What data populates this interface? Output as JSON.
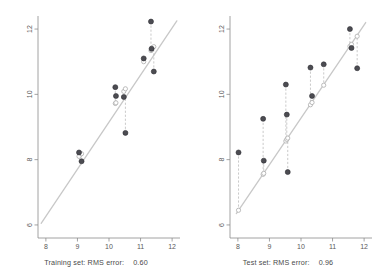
{
  "figure": {
    "width": 384,
    "height": 278,
    "background": "#ffffff",
    "panel_count": 2
  },
  "style": {
    "point_color": "#4c4c52",
    "point_edge_color": "#2e2e33",
    "line_color": "#c8c8c8",
    "residual_color": "#bdbdbd",
    "predicted_marker_color": "#b4b4b4",
    "axis_color": "#8c8c8c",
    "tick_label_color": "#5a5a5a",
    "caption_color": "#4a4a4a"
  },
  "chart_data": [
    {
      "type": "scatter",
      "panel": "left",
      "title": "",
      "xlabel": "",
      "ylabel": "",
      "xlim": [
        7.75,
        12.25
      ],
      "ylim": [
        5.6,
        12.4
      ],
      "xticks": [
        8,
        9,
        10,
        11,
        12
      ],
      "xtick_labels": [
        "8",
        "9",
        "10",
        "11",
        "12"
      ],
      "yticks": [
        6,
        8,
        10,
        12
      ],
      "ytick_labels": [
        "6",
        "8",
        "10",
        "12"
      ],
      "grid": false,
      "legend": null,
      "reference_line": {
        "name": "regression-line",
        "type": "line",
        "x": [
          7.85,
          12.15
        ],
        "y": [
          6.05,
          12.25
        ],
        "color": "#c8c8c8"
      },
      "series": [
        {
          "name": "observed",
          "marker": "filled-circle",
          "color": "#4c4c52",
          "x": [
            9.05,
            9.13,
            10.2,
            10.22,
            10.47,
            10.52,
            11.1,
            11.33,
            11.35,
            11.42
          ],
          "values": [
            8.22,
            7.95,
            10.22,
            9.95,
            9.92,
            8.82,
            11.1,
            12.23,
            11.4,
            10.7
          ]
        },
        {
          "name": "predicted",
          "marker": "open-circle",
          "color": "#b4b4b4",
          "x": [
            9.05,
            9.13,
            10.2,
            10.22,
            10.47,
            10.52,
            11.1,
            11.33,
            11.35,
            11.42
          ],
          "values": [
            8.1,
            8.18,
            9.72,
            9.74,
            10.09,
            10.17,
            11.0,
            11.34,
            11.36,
            11.46
          ]
        }
      ],
      "residual_pairs": [
        {
          "x": 9.05,
          "observed": 8.22,
          "predicted": 8.1
        },
        {
          "x": 9.13,
          "observed": 7.95,
          "predicted": 8.18
        },
        {
          "x": 10.2,
          "observed": 10.22,
          "predicted": 9.72
        },
        {
          "x": 10.22,
          "observed": 9.95,
          "predicted": 9.74
        },
        {
          "x": 10.47,
          "observed": 9.92,
          "predicted": 10.09
        },
        {
          "x": 10.52,
          "observed": 8.82,
          "predicted": 10.17
        },
        {
          "x": 11.1,
          "observed": 11.1,
          "predicted": 11.0
        },
        {
          "x": 11.33,
          "observed": 12.23,
          "predicted": 11.34
        },
        {
          "x": 11.35,
          "observed": 11.4,
          "predicted": 11.36
        },
        {
          "x": 11.42,
          "observed": 10.7,
          "predicted": 11.46
        }
      ],
      "caption_label": "Training set: RMS error:",
      "caption_value": "0.60"
    },
    {
      "type": "scatter",
      "panel": "right",
      "title": "",
      "xlabel": "",
      "ylabel": "",
      "xlim": [
        7.75,
        12.25
      ],
      "ylim": [
        5.6,
        12.4
      ],
      "xticks": [
        8,
        9,
        10,
        11,
        12
      ],
      "xtick_labels": [
        "8",
        "9",
        "10",
        "11",
        "12"
      ],
      "yticks": [
        6,
        8,
        10,
        12
      ],
      "ytick_labels": [
        "6",
        "8",
        "10",
        "12"
      ],
      "grid": false,
      "legend": null,
      "reference_line": {
        "name": "regression-line",
        "type": "line",
        "x": [
          7.95,
          12.05
        ],
        "y": [
          6.35,
          12.2
        ],
        "color": "#c8c8c8"
      },
      "series": [
        {
          "name": "observed",
          "marker": "filled-circle",
          "color": "#4c4c52",
          "x": [
            8.02,
            8.8,
            8.82,
            9.52,
            9.55,
            9.58,
            10.3,
            10.35,
            10.72,
            11.55,
            11.6,
            11.78
          ],
          "values": [
            8.22,
            9.25,
            7.97,
            10.3,
            9.38,
            7.62,
            10.82,
            9.95,
            10.92,
            12.0,
            11.42,
            10.8
          ]
        },
        {
          "name": "predicted",
          "marker": "open-circle",
          "color": "#b4b4b4",
          "x": [
            8.02,
            8.8,
            8.82,
            9.52,
            9.55,
            9.58,
            10.3,
            10.35,
            10.72,
            11.55,
            11.6,
            11.78
          ],
          "values": [
            6.45,
            7.55,
            7.58,
            8.57,
            8.62,
            8.66,
            9.68,
            9.75,
            10.28,
            11.47,
            11.53,
            11.78
          ]
        }
      ],
      "residual_pairs": [
        {
          "x": 8.02,
          "observed": 8.22,
          "predicted": 6.45
        },
        {
          "x": 8.8,
          "observed": 9.25,
          "predicted": 7.55
        },
        {
          "x": 8.82,
          "observed": 7.97,
          "predicted": 7.58
        },
        {
          "x": 9.52,
          "observed": 10.3,
          "predicted": 8.57
        },
        {
          "x": 9.55,
          "observed": 9.38,
          "predicted": 8.62
        },
        {
          "x": 9.58,
          "observed": 7.62,
          "predicted": 8.66
        },
        {
          "x": 10.3,
          "observed": 10.82,
          "predicted": 9.68
        },
        {
          "x": 10.35,
          "observed": 9.95,
          "predicted": 9.75
        },
        {
          "x": 10.72,
          "observed": 10.92,
          "predicted": 10.28
        },
        {
          "x": 11.55,
          "observed": 12.0,
          "predicted": 11.47
        },
        {
          "x": 11.6,
          "observed": 11.42,
          "predicted": 11.53
        },
        {
          "x": 11.78,
          "observed": 10.8,
          "predicted": 11.78
        }
      ],
      "caption_label": "Test set: RMS error:",
      "caption_value": "0.96"
    }
  ]
}
